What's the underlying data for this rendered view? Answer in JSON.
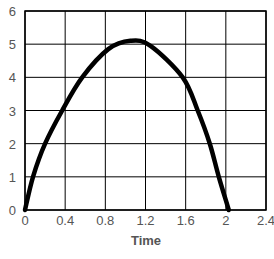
{
  "chart_data": {
    "type": "line",
    "title": "",
    "xlabel": "Time",
    "ylabel": "",
    "xlim": [
      0,
      2.4
    ],
    "ylim": [
      0,
      6
    ],
    "grid": true,
    "legend": null,
    "x_ticks": [
      "0",
      "0.4",
      "0.8",
      "1.2",
      "1.6",
      "2",
      "2.4"
    ],
    "y_ticks": [
      "0",
      "1",
      "2",
      "3",
      "4",
      "5",
      "6"
    ],
    "series": [
      {
        "name": "curve",
        "color": "#000000",
        "x": [
          0,
          0.08,
          0.2,
          0.37,
          0.57,
          0.83,
          1.05,
          1.25,
          1.57,
          1.72,
          1.84,
          1.93,
          2.03
        ],
        "values": [
          0,
          1,
          2,
          3,
          4,
          4.85,
          5.1,
          4.95,
          4,
          3,
          2,
          1,
          0
        ]
      }
    ]
  }
}
